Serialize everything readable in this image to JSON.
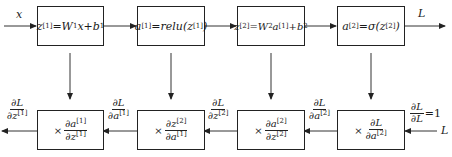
{
  "forward": {
    "input_label": "x",
    "output_label": "L",
    "boxes": [
      {
        "lhs": "z",
        "lhs_sup": "[1]",
        "rhs": "=W",
        "rhs_sub": "1",
        "rhs_tail": "x+b",
        "rhs_tail_sub": "1"
      },
      {
        "lhs": "a",
        "lhs_sup": "[1]",
        "rhs": "=relu(z",
        "rhs_sup": "[1]",
        "rhs_tail": ")"
      },
      {
        "lhs": "z",
        "lhs_sup": "[2]",
        "rhs": "=W",
        "rhs_sub": "2",
        "rhs_mid": "a",
        "rhs_mid_sup": "[1]",
        "rhs_tail": "+b",
        "rhs_tail_sub": "2"
      },
      {
        "lhs": "a",
        "lhs_sup": "[2]",
        "rhs": "=σ(z",
        "rhs_sup": "[2]",
        "rhs_tail": ")"
      }
    ]
  },
  "backward": {
    "input_label": "L",
    "start_grad": {
      "num": "∂L",
      "den": "∂L",
      "eq": "=1"
    },
    "boxes": [
      {
        "times": "×",
        "num": "∂a",
        "num_sup": "[1]",
        "den": "∂z",
        "den_sup": "[1]"
      },
      {
        "times": "×",
        "num": "∂z",
        "num_sup": "[2]",
        "den": "∂a",
        "den_sup": "[1]"
      },
      {
        "times": "×",
        "num": "∂a",
        "num_sup": "[2]",
        "den": "∂z",
        "den_sup": "[2]"
      },
      {
        "times": "×",
        "num": "∂L",
        "num_sup": "",
        "den": "∂a",
        "den_sup": "[2]"
      }
    ],
    "grads": [
      {
        "num": "∂L",
        "den": "∂z",
        "den_sup": "[1]"
      },
      {
        "num": "∂L",
        "den": "∂a",
        "den_sup": "[1]"
      },
      {
        "num": "∂L",
        "den": "∂z",
        "den_sup": "[2]"
      },
      {
        "num": "∂L",
        "den": "∂a",
        "den_sup": "[2]"
      }
    ]
  }
}
